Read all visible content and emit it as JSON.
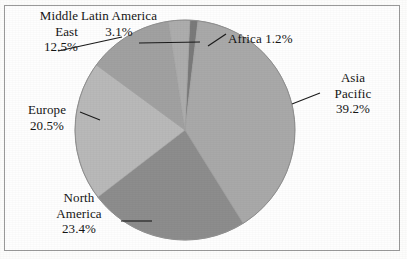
{
  "figure": {
    "title": "",
    "background_color": "#fefefe",
    "frame_color": "#9a9a9a",
    "text_color": "#151515",
    "leader_line_color": "#1a1a1a"
  },
  "chart_data": {
    "type": "pie",
    "title": "",
    "xlabel": "",
    "ylabel": "",
    "legend_position": "none",
    "grid": false,
    "units": "percent",
    "total": 99.9,
    "start_angle_deg": 0,
    "direction": "clockwise",
    "categories": [
      "Africa",
      "Asia Pacific",
      "North America",
      "Europe",
      "Middle East",
      "Latin America"
    ],
    "values": [
      1.2,
      39.2,
      23.4,
      20.5,
      12.5,
      3.1
    ],
    "colors": [
      "#7a7a7a",
      "#a9a9a9",
      "#8d8d8d",
      "#b9b9b9",
      "#a1a1a1",
      "#adadad"
    ],
    "slices": [
      {
        "label": "Africa",
        "value": 1.2,
        "value_text": "1.2%",
        "color": "#7a7a7a",
        "label_lines": [
          "Africa 1.2%"
        ]
      },
      {
        "label": "Asia Pacific",
        "value": 39.2,
        "value_text": "39.2%",
        "color": "#a9a9a9",
        "label_lines": [
          "Asia",
          "Pacific",
          "39.2%"
        ]
      },
      {
        "label": "North America",
        "value": 23.4,
        "value_text": "23.4%",
        "color": "#8d8d8d",
        "label_lines": [
          "North",
          "America",
          "23.4%"
        ]
      },
      {
        "label": "Europe",
        "value": 20.5,
        "value_text": "20.5%",
        "color": "#b9b9b9",
        "label_lines": [
          "Europe",
          "20.5%"
        ]
      },
      {
        "label": "Middle East",
        "value": 12.5,
        "value_text": "12.5%",
        "color": "#a1a1a1",
        "label_lines": [
          "Middle",
          "East",
          "12.5%"
        ]
      },
      {
        "label": "Latin America",
        "value": 3.1,
        "value_text": "3.1%",
        "color": "#adadad",
        "label_lines": [
          "Latin America",
          "3.1%"
        ]
      }
    ]
  },
  "labels": {
    "middle_east": {
      "line1": "Middle",
      "line2": "East",
      "line3": "12.5%"
    },
    "latin_america": {
      "line1": "Latin America",
      "line2": "3.1%"
    },
    "africa": {
      "line1": "Africa 1.2%"
    },
    "asia_pacific": {
      "line1": "Asia",
      "line2": "Pacific",
      "line3": "39.2%"
    },
    "europe": {
      "line1": "Europe",
      "line2": "20.5%"
    },
    "north_america": {
      "line1": "North",
      "line2": "America",
      "line3": "23.4%"
    }
  }
}
